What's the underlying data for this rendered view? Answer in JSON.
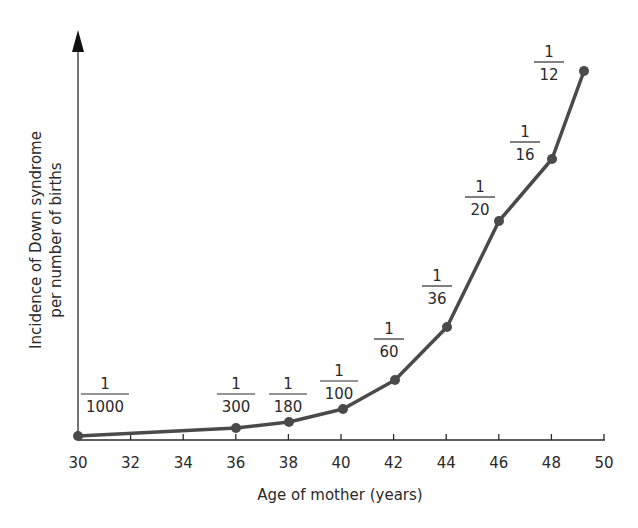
{
  "chart_data": {
    "type": "line",
    "title": "",
    "xlabel": "Age of mother (years)",
    "ylabel_lines": [
      "Incidence of Down syndrome",
      "per number of births"
    ],
    "xlim": [
      30,
      50
    ],
    "x_ticks": [
      30,
      32,
      34,
      36,
      38,
      40,
      42,
      44,
      46,
      48,
      50
    ],
    "grid": false,
    "legend": null,
    "series": [
      {
        "name": "Incidence of Down syndrome",
        "color": "#4a4a4a",
        "points": [
          {
            "x": 30,
            "label": "1/1000",
            "numerator": "1",
            "denominator": "1000",
            "value": 0.001
          },
          {
            "x": 36,
            "label": "1/300",
            "numerator": "1",
            "denominator": "300",
            "value": 0.00333
          },
          {
            "x": 38,
            "label": "1/180",
            "numerator": "1",
            "denominator": "180",
            "value": 0.00556
          },
          {
            "x": 40,
            "label": "1/100",
            "numerator": "1",
            "denominator": "100",
            "value": 0.01
          },
          {
            "x": 42,
            "label": "1/60",
            "numerator": "1",
            "denominator": "60",
            "value": 0.01667
          },
          {
            "x": 44,
            "label": "1/36",
            "numerator": "1",
            "denominator": "36",
            "value": 0.02778
          },
          {
            "x": 46,
            "label": "1/20",
            "numerator": "1",
            "denominator": "20",
            "value": 0.05
          },
          {
            "x": 48,
            "label": "1/16",
            "numerator": "1",
            "denominator": "16",
            "value": 0.0625
          },
          {
            "x": 49.2,
            "label": "1/12",
            "numerator": "1",
            "denominator": "12",
            "value": 0.0833
          }
        ]
      }
    ]
  },
  "layout": {
    "plot_px": [
      {
        "px": 78,
        "py": 436,
        "lx": 105,
        "ly": 393
      },
      {
        "px": 236,
        "py": 428,
        "lx": 236,
        "ly": 393
      },
      {
        "px": 289,
        "py": 422,
        "lx": 288,
        "ly": 393
      },
      {
        "px": 343,
        "py": 409,
        "lx": 339,
        "ly": 380
      },
      {
        "px": 395,
        "py": 380,
        "lx": 389,
        "ly": 338
      },
      {
        "px": 447,
        "py": 327,
        "lx": 437,
        "ly": 285
      },
      {
        "px": 499,
        "py": 221,
        "lx": 480,
        "ly": 196
      },
      {
        "px": 552,
        "py": 159,
        "lx": 525,
        "ly": 141
      },
      {
        "px": 584,
        "py": 71,
        "lx": 549,
        "ly": 61
      }
    ]
  }
}
